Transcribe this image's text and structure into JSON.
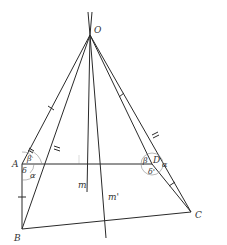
{
  "diagram": {
    "title": "",
    "points": {
      "O": {
        "label": "O",
        "x": 90,
        "y": 35
      },
      "A": {
        "label": "A",
        "x": 22,
        "y": 164
      },
      "B": {
        "label": "B",
        "x": 22,
        "y": 229
      },
      "C": {
        "label": "C",
        "x": 191,
        "y": 212
      },
      "D": {
        "label": "D",
        "x": 152,
        "y": 164
      }
    },
    "lines": {
      "m": {
        "label": "m"
      },
      "m_prime": {
        "label": "m'"
      }
    },
    "angles": {
      "alpha_A": "α",
      "beta_A": "β",
      "delta_A": "δ",
      "alpha_D": "α",
      "beta_D": "β",
      "delta_D": "δ'"
    },
    "colors": {
      "stroke": "#2a2a2a",
      "background": "#ffffff"
    }
  }
}
